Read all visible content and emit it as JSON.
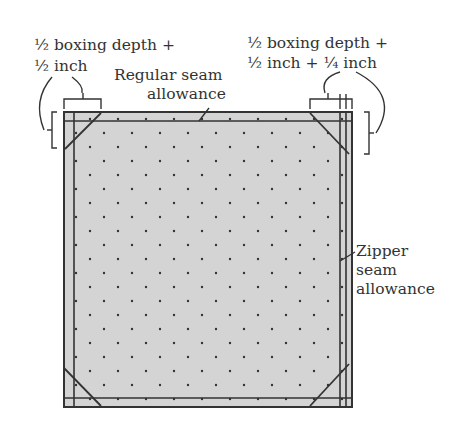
{
  "diagram": {
    "labels": {
      "top_left_line1": "½ boxing depth +",
      "top_left_line2": "½ inch",
      "regular_seam_line1": "Regular seam",
      "regular_seam_line2": "allowance",
      "top_right_line1": "½ boxing depth +",
      "top_right_line2": "½ inch + ¼ inch",
      "zipper_line1": "Zipper",
      "zipper_line2": "seam",
      "zipper_line3": "allowance"
    },
    "colors": {
      "fabric_fill": "#d4d4d4",
      "dot": "#333333",
      "line": "#333333",
      "background": "#ffffff"
    }
  }
}
